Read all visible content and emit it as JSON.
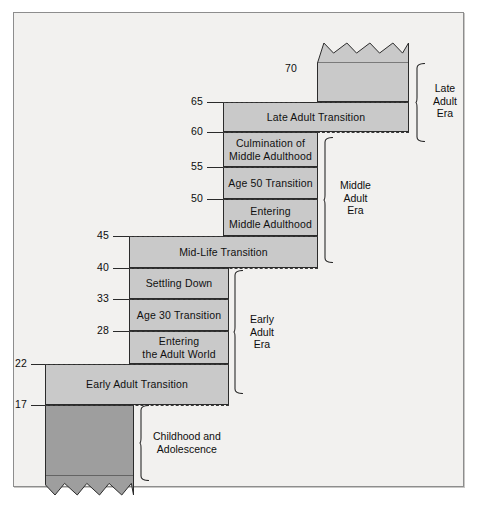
{
  "diagram": {
    "colors": {
      "band_fill": "#c9c9c9",
      "band_fill_dark": "#9e9e9e",
      "outline": "#2b2b2b",
      "page_background": "#f2f1ef",
      "frame_border": "#8d8d8d"
    },
    "age_labels": [
      {
        "value": "70",
        "y": 68
      },
      {
        "value": "65",
        "y": 101
      },
      {
        "value": "60",
        "y": 131
      },
      {
        "value": "55",
        "y": 166
      },
      {
        "value": "50",
        "y": 198
      },
      {
        "value": "45",
        "y": 235
      },
      {
        "value": "40",
        "y": 267
      },
      {
        "value": "33",
        "y": 298
      },
      {
        "value": "28",
        "y": 330
      },
      {
        "value": "22",
        "y": 363
      },
      {
        "value": "17",
        "y": 404
      }
    ],
    "bands": [
      {
        "id": "late-adulthood",
        "label": "",
        "x": 316,
        "y": 62,
        "w": 92,
        "h": 39,
        "shade": "light",
        "zigzag": "top"
      },
      {
        "id": "late-adult-transition",
        "label": "Late Adult Transition",
        "x": 222,
        "y": 101,
        "w": 186,
        "h": 30,
        "shade": "light",
        "zigzag": "none"
      },
      {
        "id": "culmination",
        "label": "Culmination of\nMiddle Adulthood",
        "x": 222,
        "y": 131,
        "w": 95,
        "h": 35,
        "shade": "light",
        "zigzag": "none"
      },
      {
        "id": "age-50-transition",
        "label": "Age 50 Transition",
        "x": 222,
        "y": 166,
        "w": 95,
        "h": 32,
        "shade": "light",
        "zigzag": "none"
      },
      {
        "id": "entering-middle",
        "label": "Entering\nMiddle Adulthood",
        "x": 222,
        "y": 198,
        "w": 95,
        "h": 37,
        "shade": "light",
        "zigzag": "none"
      },
      {
        "id": "mid-life-transition",
        "label": "Mid-Life Transition",
        "x": 128,
        "y": 235,
        "w": 189,
        "h": 32,
        "shade": "light",
        "zigzag": "none"
      },
      {
        "id": "settling-down",
        "label": "Settling Down",
        "x": 128,
        "y": 267,
        "w": 100,
        "h": 31,
        "shade": "light",
        "zigzag": "none"
      },
      {
        "id": "age-30-transition",
        "label": "Age 30 Transition",
        "x": 128,
        "y": 298,
        "w": 100,
        "h": 32,
        "shade": "light",
        "zigzag": "none"
      },
      {
        "id": "entering-adult-world",
        "label": "Entering\nthe Adult World",
        "x": 128,
        "y": 330,
        "w": 100,
        "h": 33,
        "shade": "light",
        "zigzag": "none"
      },
      {
        "id": "early-adult-transition",
        "label": "Early Adult Transition",
        "x": 44,
        "y": 363,
        "w": 184,
        "h": 41,
        "shade": "light",
        "zigzag": "none"
      },
      {
        "id": "childhood-adolescence",
        "label": "",
        "x": 44,
        "y": 404,
        "w": 89,
        "h": 71,
        "shade": "dark",
        "zigzag": "bottom"
      }
    ],
    "era_brackets": [
      {
        "id": "late-adult-era",
        "label": "Late\nAdult\nEra",
        "bracket_x": 414,
        "bracket_y": 62,
        "bracket_h": 79,
        "label_x": 432,
        "label_y": 81
      },
      {
        "id": "middle-adult-era",
        "label": "Middle\nAdult\nEra",
        "bracket_x": 322,
        "bracket_y": 136,
        "bracket_h": 126,
        "label_x": 339,
        "label_y": 178
      },
      {
        "id": "early-adult-era",
        "label": "Early\nAdult\nEra",
        "bracket_x": 232,
        "bracket_y": 269,
        "bracket_h": 124,
        "label_x": 249,
        "label_y": 312
      },
      {
        "id": "childhood-bracket",
        "label": "Childhood and\nAdolescence",
        "bracket_x": 138,
        "bracket_y": 404,
        "bracket_h": 76,
        "label_x": 152,
        "label_y": 429
      }
    ],
    "dashed_separators": [
      {
        "id": "sep-70",
        "x": 316,
        "w": 92,
        "y": 101
      },
      {
        "id": "sep-65",
        "x": 222,
        "w": 186,
        "y": 101
      },
      {
        "id": "sep-60",
        "x": 222,
        "w": 186,
        "y": 131
      },
      {
        "id": "sep-55",
        "x": 222,
        "w": 95,
        "y": 166
      },
      {
        "id": "sep-50",
        "x": 222,
        "w": 95,
        "y": 198
      },
      {
        "id": "sep-45",
        "x": 128,
        "w": 189,
        "y": 235
      },
      {
        "id": "sep-40",
        "x": 128,
        "w": 189,
        "y": 267
      },
      {
        "id": "sep-33",
        "x": 128,
        "w": 100,
        "y": 298
      },
      {
        "id": "sep-28",
        "x": 128,
        "w": 100,
        "y": 330
      },
      {
        "id": "sep-22",
        "x": 44,
        "w": 184,
        "y": 363
      },
      {
        "id": "sep-17",
        "x": 44,
        "w": 184,
        "y": 404
      }
    ],
    "ticks": [
      {
        "id": "tick-70",
        "x": 300,
        "w": 16,
        "y": 101
      },
      {
        "id": "tick-65",
        "x": 206,
        "w": 16,
        "y": 101
      },
      {
        "id": "tick-60",
        "x": 206,
        "w": 16,
        "y": 131
      },
      {
        "id": "tick-55",
        "x": 206,
        "w": 16,
        "y": 166
      },
      {
        "id": "tick-50",
        "x": 206,
        "w": 16,
        "y": 198
      },
      {
        "id": "tick-45",
        "x": 112,
        "w": 16,
        "y": 235
      },
      {
        "id": "tick-40",
        "x": 112,
        "w": 16,
        "y": 267
      },
      {
        "id": "tick-33",
        "x": 112,
        "w": 16,
        "y": 298
      },
      {
        "id": "tick-28",
        "x": 112,
        "w": 16,
        "y": 330
      },
      {
        "id": "tick-22",
        "x": 30,
        "w": 14,
        "y": 363
      },
      {
        "id": "tick-17",
        "x": 30,
        "w": 14,
        "y": 404
      }
    ]
  }
}
